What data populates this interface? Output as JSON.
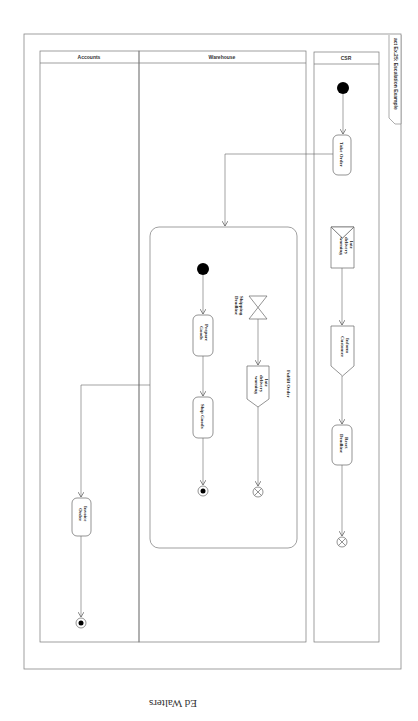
{
  "diagram": {
    "frame_label": "act Ex.25: Escalation Example",
    "orientation": "rotated 90deg clockwise (read with page turned)",
    "caption": "Ed Walters",
    "swimlanes": [
      {
        "id": "accounts",
        "label": "Accounts"
      },
      {
        "id": "warehouse",
        "label": "Warehouse"
      },
      {
        "id": "csr",
        "label": "CSR"
      }
    ],
    "region": {
      "label": "Fulfill Order"
    },
    "nodes": {
      "csr_initial": {
        "type": "initial"
      },
      "take_order": {
        "type": "action",
        "label": "Take Order"
      },
      "late_delivery_accept": {
        "type": "accept-event",
        "label_lines": [
          "late",
          "delivery",
          "warning"
        ]
      },
      "inform_customer": {
        "type": "send-signal",
        "label_lines": [
          "Inform",
          "Customer"
        ]
      },
      "reset_deadline": {
        "type": "action",
        "label_lines": [
          "Reset",
          "Deadline"
        ]
      },
      "csr_flow_final": {
        "type": "flow-final"
      },
      "wh_initial": {
        "type": "initial"
      },
      "prepare_goods": {
        "type": "action",
        "label_lines": [
          "Prepare",
          "Goods"
        ]
      },
      "ship_goods": {
        "type": "action",
        "label": "Ship Goods"
      },
      "wh_activity_final": {
        "type": "activity-final"
      },
      "shipping_deadline": {
        "type": "time-event",
        "label_lines": [
          "Shipping",
          "Deadline"
        ]
      },
      "late_delivery_send": {
        "type": "send-signal",
        "label_lines": [
          "late",
          "delivery",
          "warning"
        ]
      },
      "wh_flow_final": {
        "type": "flow-final"
      },
      "invoice_order": {
        "type": "action",
        "label_lines": [
          "Invoice",
          "Order"
        ]
      },
      "acc_activity_final": {
        "type": "activity-final"
      }
    },
    "edges": [
      [
        "csr_initial",
        "take_order"
      ],
      [
        "take_order",
        "Fulfill Order"
      ],
      [
        "late_delivery_accept",
        "inform_customer"
      ],
      [
        "inform_customer",
        "reset_deadline"
      ],
      [
        "reset_deadline",
        "csr_flow_final"
      ],
      [
        "wh_initial",
        "prepare_goods"
      ],
      [
        "prepare_goods",
        "ship_goods"
      ],
      [
        "ship_goods",
        "wh_activity_final"
      ],
      [
        "shipping_deadline",
        "late_delivery_send"
      ],
      [
        "late_delivery_send",
        "wh_flow_final"
      ],
      [
        "Fulfill Order",
        "invoice_order"
      ],
      [
        "invoice_order",
        "acc_activity_final"
      ]
    ]
  }
}
